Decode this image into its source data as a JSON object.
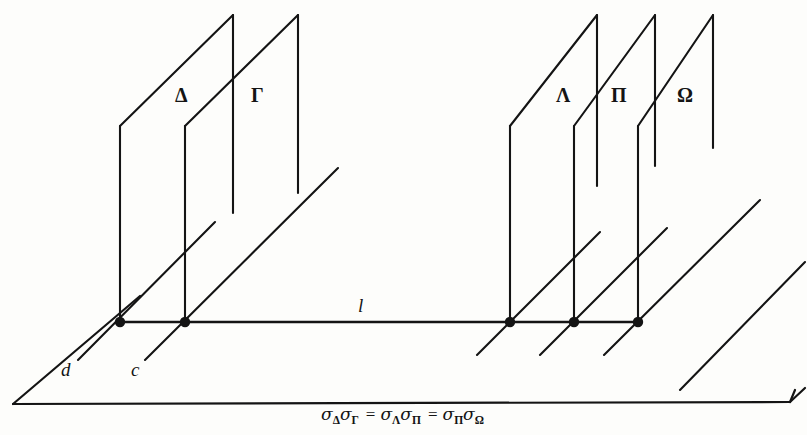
{
  "figure": {
    "kind": "geometry-diagram",
    "stroke_color": "#141414",
    "background_color": "#fdfdfb"
  },
  "planes": [
    {
      "id": "delta",
      "label": "Δ",
      "side": "left",
      "label_x": 175,
      "label_y": 85
    },
    {
      "id": "gamma",
      "label": "Γ",
      "side": "left",
      "label_x": 251,
      "label_y": 85
    },
    {
      "id": "lambda",
      "label": "Λ",
      "side": "right",
      "label_x": 556,
      "label_y": 85
    },
    {
      "id": "pi",
      "label": "Π",
      "side": "right",
      "label_x": 611,
      "label_y": 85
    },
    {
      "id": "omega",
      "label": "Ω",
      "side": "right",
      "label_x": 677,
      "label_y": 85
    }
  ],
  "lines": [
    {
      "id": "l",
      "label": "l",
      "label_x": 358,
      "label_y": 296
    },
    {
      "id": "d",
      "label": "d",
      "label_x": 61,
      "label_y": 360
    },
    {
      "id": "c",
      "label": "c",
      "label_x": 131,
      "label_y": 360
    }
  ],
  "points": [
    {
      "id": "p-delta",
      "x": 120,
      "y": 322
    },
    {
      "id": "p-gamma",
      "x": 185,
      "y": 322
    },
    {
      "id": "p-lambda",
      "x": 510,
      "y": 322
    },
    {
      "id": "p-pi",
      "x": 574,
      "y": 322
    },
    {
      "id": "p-omega",
      "x": 638,
      "y": 322
    }
  ],
  "caption": {
    "sigma": "σ",
    "equals": "=",
    "terms": [
      {
        "sub_a": "Δ",
        "sub_b": "Γ"
      },
      {
        "sub_a": "Λ",
        "sub_b": "Π"
      },
      {
        "sub_a": "Π",
        "sub_b": "Ω"
      }
    ],
    "plain_text": "σΔ σΓ = σΛ σΠ = σΠ σΩ"
  }
}
